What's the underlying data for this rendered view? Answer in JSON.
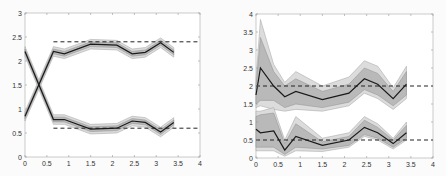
{
  "chart_data": [
    {
      "type": "line",
      "title": "",
      "xlabel": "",
      "ylabel": "",
      "xlim": [
        0,
        4
      ],
      "ylim": [
        0,
        3
      ],
      "xticks": [
        "0",
        "0.5",
        "1",
        "1.5",
        "2",
        "2.5",
        "3",
        "3.5",
        "4"
      ],
      "yticks": [
        "0",
        "0.5",
        "1",
        "1.5",
        "2",
        "2.5",
        "3"
      ],
      "grid": false,
      "x": [
        0,
        0.65,
        0.9,
        1.5,
        2.1,
        2.45,
        2.75,
        3.1,
        3.4
      ],
      "series": [
        {
          "name": "upper-mean",
          "values": [
            0.85,
            2.2,
            2.15,
            2.35,
            2.33,
            2.15,
            2.18,
            2.38,
            2.18
          ],
          "band_inner": 0.05,
          "band_outer": 0.1
        },
        {
          "name": "lower-mean",
          "values": [
            2.2,
            0.78,
            0.78,
            0.58,
            0.6,
            0.75,
            0.72,
            0.52,
            0.72
          ],
          "band_inner": 0.05,
          "band_outer": 0.1
        }
      ],
      "reference_lines": [
        {
          "y": 2.4,
          "x_start": 0.65,
          "x_end": 4,
          "style": "dashed"
        },
        {
          "y": 0.6,
          "x_start": 0.65,
          "x_end": 4,
          "style": "dashed"
        }
      ]
    },
    {
      "type": "line",
      "title": "",
      "xlabel": "",
      "ylabel": "",
      "xlim": [
        0,
        4
      ],
      "ylim": [
        0,
        4
      ],
      "xticks": [
        "0",
        "0.5",
        "1",
        "1.5",
        "2",
        "2.5",
        "3",
        "3.5",
        "4"
      ],
      "yticks": [
        "0",
        "0.5",
        "1",
        "1.5",
        "2",
        "2.5",
        "3",
        "3.5",
        "4"
      ],
      "grid": false,
      "x": [
        0,
        0.1,
        0.4,
        0.65,
        0.9,
        1.5,
        2.1,
        2.45,
        2.75,
        3.1,
        3.4
      ],
      "series": [
        {
          "name": "upper-mean",
          "values": [
            1.75,
            2.5,
            2.0,
            1.7,
            1.85,
            1.62,
            1.8,
            2.2,
            2.05,
            1.65,
            2.05
          ],
          "inner_upper": [
            2.0,
            3.35,
            2.4,
            2.0,
            2.2,
            1.85,
            2.05,
            2.5,
            2.35,
            1.85,
            2.4
          ],
          "inner_lower": [
            1.5,
            1.6,
            1.6,
            1.4,
            1.5,
            1.4,
            1.55,
            1.9,
            1.75,
            1.45,
            1.75
          ],
          "outer_upper": [
            2.2,
            3.85,
            2.6,
            2.1,
            2.4,
            2.0,
            2.25,
            2.7,
            2.55,
            1.95,
            2.55
          ],
          "outer_lower": [
            1.4,
            1.45,
            1.35,
            1.3,
            1.35,
            1.3,
            1.45,
            1.8,
            1.65,
            1.35,
            1.65
          ]
        },
        {
          "name": "lower-mean",
          "values": [
            0.8,
            0.7,
            0.75,
            0.22,
            0.6,
            0.35,
            0.5,
            0.85,
            0.7,
            0.4,
            0.7
          ],
          "inner_upper": [
            1.15,
            1.2,
            1.25,
            0.4,
            0.95,
            0.45,
            0.6,
            1.05,
            0.85,
            0.5,
            0.9
          ],
          "inner_lower": [
            0.3,
            0.3,
            0.3,
            0.1,
            0.3,
            0.25,
            0.35,
            0.65,
            0.55,
            0.3,
            0.55
          ],
          "outer_upper": [
            1.3,
            1.3,
            1.4,
            0.5,
            1.15,
            0.55,
            0.7,
            1.15,
            0.95,
            0.55,
            1.0
          ],
          "outer_lower": [
            0.2,
            0.2,
            0.2,
            0.05,
            0.2,
            0.18,
            0.3,
            0.6,
            0.5,
            0.25,
            0.5
          ]
        }
      ],
      "reference_lines": [
        {
          "y": 2.0,
          "x_start": 0,
          "x_end": 4,
          "style": "dashed"
        },
        {
          "y": 0.5,
          "x_start": 0,
          "x_end": 4,
          "style": "dashed"
        }
      ]
    }
  ]
}
